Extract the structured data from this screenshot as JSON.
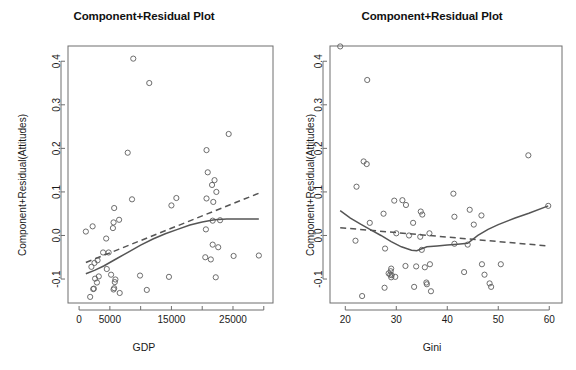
{
  "figure": {
    "width": 576,
    "height": 370,
    "background": "#ffffff",
    "point_color": "#5d5d5d",
    "line_color": "#555555",
    "axis_color": "#6e6e6e"
  },
  "panels": [
    {
      "id": "gdp-panel",
      "title": "Component+Residual Plot",
      "xlabel": "GDP",
      "ylabel": "Component+Residual(Attitudes)"
    },
    {
      "id": "gini-panel",
      "title": "Component+Residual Plot",
      "xlabel": "Gini",
      "ylabel": "Component+Residual(Attitudes)"
    }
  ],
  "chart_data": [
    {
      "type": "scatter",
      "id": "gdp-panel",
      "title": "Component+Residual Plot",
      "xlabel": "GDP",
      "ylabel": "Component+Residual(Attitudes)",
      "xlim": [
        -1800,
        31500
      ],
      "ylim": [
        -0.155,
        0.435
      ],
      "grid": false,
      "legend": "none",
      "xticks": [
        0,
        5000,
        10000,
        15000,
        20000,
        25000,
        30000
      ],
      "xticklabels": [
        "0",
        "5000",
        "",
        "15000",
        "",
        "25000",
        ""
      ],
      "yticks": [
        -0.1,
        0.0,
        0.1,
        0.2,
        0.3,
        0.4
      ],
      "yticklabels": [
        "-0.1",
        "0.0",
        "0.1",
        "0.2",
        "0.3",
        "0.4"
      ],
      "points": [
        [
          8800,
          0.406
        ],
        [
          11400,
          0.35
        ],
        [
          7900,
          0.19
        ],
        [
          20700,
          0.196
        ],
        [
          24300,
          0.233
        ],
        [
          20900,
          0.145
        ],
        [
          22000,
          0.127
        ],
        [
          21600,
          0.116
        ],
        [
          20700,
          0.085
        ],
        [
          8600,
          0.083
        ],
        [
          15800,
          0.086
        ],
        [
          22300,
          0.1
        ],
        [
          21800,
          0.077
        ],
        [
          15000,
          0.069
        ],
        [
          5700,
          0.063
        ],
        [
          6500,
          0.036
        ],
        [
          5600,
          0.03
        ],
        [
          5500,
          0.017
        ],
        [
          21700,
          0.034
        ],
        [
          22900,
          0.035
        ],
        [
          1100,
          0.009
        ],
        [
          2200,
          0.021
        ],
        [
          20600,
          0.014
        ],
        [
          4400,
          -0.007
        ],
        [
          3900,
          -0.039
        ],
        [
          20500,
          -0.05
        ],
        [
          4800,
          -0.039
        ],
        [
          2000,
          -0.072
        ],
        [
          3000,
          -0.057
        ],
        [
          2500,
          -0.063
        ],
        [
          21700,
          -0.021
        ],
        [
          22600,
          -0.027
        ],
        [
          21400,
          -0.055
        ],
        [
          25100,
          -0.047
        ],
        [
          29200,
          -0.046
        ],
        [
          4500,
          -0.077
        ],
        [
          2600,
          -0.099
        ],
        [
          3200,
          -0.094
        ],
        [
          5200,
          -0.09
        ],
        [
          9900,
          -0.092
        ],
        [
          14600,
          -0.095
        ],
        [
          22200,
          -0.096
        ],
        [
          2900,
          -0.108
        ],
        [
          5800,
          -0.107
        ],
        [
          5900,
          -0.101
        ],
        [
          2300,
          -0.123
        ],
        [
          2400,
          -0.122
        ],
        [
          5600,
          -0.124
        ],
        [
          5700,
          -0.121
        ],
        [
          11000,
          -0.125
        ],
        [
          1800,
          -0.141
        ],
        [
          6600,
          -0.132
        ]
      ],
      "smooth_curve": [
        [
          1100,
          -0.088
        ],
        [
          2500,
          -0.08
        ],
        [
          4000,
          -0.07
        ],
        [
          6000,
          -0.054
        ],
        [
          8000,
          -0.038
        ],
        [
          10000,
          -0.022
        ],
        [
          12000,
          -0.008
        ],
        [
          14000,
          0.004
        ],
        [
          16000,
          0.014
        ],
        [
          18000,
          0.024
        ],
        [
          20000,
          0.031
        ],
        [
          22000,
          0.036
        ],
        [
          24000,
          0.038
        ],
        [
          26000,
          0.038
        ],
        [
          29200,
          0.038
        ]
      ],
      "linear_fit": [
        [
          1100,
          -0.062
        ],
        [
          29200,
          0.097
        ]
      ]
    },
    {
      "type": "scatter",
      "id": "gini-panel",
      "title": "Component+Residual Plot",
      "xlabel": "Gini",
      "ylabel": "Component+Residual(Attitudes)",
      "xlim": [
        17.0,
        62.5
      ],
      "ylim": [
        -0.155,
        0.435
      ],
      "grid": false,
      "legend": "none",
      "xticks": [
        20,
        30,
        40,
        50,
        60
      ],
      "xticklabels": [
        "20",
        "30",
        "40",
        "50",
        "60"
      ],
      "yticks": [
        -0.1,
        0.0,
        0.1,
        0.2,
        0.3,
        0.4
      ],
      "yticklabels": [
        "-0.1",
        "0.0",
        "0.1",
        "0.2",
        "0.3",
        "0.4"
      ],
      "points": [
        [
          19.0,
          0.434
        ],
        [
          24.3,
          0.357
        ],
        [
          23.6,
          0.17
        ],
        [
          24.2,
          0.164
        ],
        [
          22.2,
          0.112
        ],
        [
          55.9,
          0.184
        ],
        [
          29.6,
          0.08
        ],
        [
          31.2,
          0.081
        ],
        [
          31.9,
          0.07
        ],
        [
          41.2,
          0.096
        ],
        [
          27.5,
          0.05
        ],
        [
          34.8,
          0.055
        ],
        [
          35.1,
          0.048
        ],
        [
          41.4,
          0.043
        ],
        [
          44.4,
          0.059
        ],
        [
          46.7,
          0.046
        ],
        [
          59.8,
          0.068
        ],
        [
          33.3,
          0.029
        ],
        [
          24.8,
          0.029
        ],
        [
          45.2,
          0.025
        ],
        [
          30.0,
          0.005
        ],
        [
          32.5,
          0.0
        ],
        [
          34.7,
          -0.003
        ],
        [
          36.5,
          0.005
        ],
        [
          41.4,
          -0.019
        ],
        [
          44.0,
          -0.021
        ],
        [
          22.0,
          -0.012
        ],
        [
          27.8,
          -0.03
        ],
        [
          35.0,
          -0.033
        ],
        [
          29.0,
          -0.076
        ],
        [
          31.8,
          -0.07
        ],
        [
          33.9,
          -0.071
        ],
        [
          35.6,
          -0.073
        ],
        [
          36.6,
          -0.066
        ],
        [
          43.3,
          -0.084
        ],
        [
          46.8,
          -0.066
        ],
        [
          47.3,
          -0.09
        ],
        [
          50.5,
          -0.066
        ],
        [
          28.5,
          -0.087
        ],
        [
          28.8,
          -0.09
        ],
        [
          29.1,
          -0.091
        ],
        [
          29.0,
          -0.096
        ],
        [
          29.8,
          -0.095
        ],
        [
          27.7,
          -0.12
        ],
        [
          33.5,
          -0.118
        ],
        [
          35.9,
          -0.108
        ],
        [
          36.0,
          -0.112
        ],
        [
          36.8,
          -0.128
        ],
        [
          23.3,
          -0.139
        ],
        [
          48.3,
          -0.11
        ],
        [
          48.6,
          -0.118
        ],
        [
          28.9,
          -0.082
        ]
      ],
      "smooth_curve": [
        [
          19.0,
          0.057
        ],
        [
          21.0,
          0.04
        ],
        [
          23.0,
          0.026
        ],
        [
          25.0,
          0.013
        ],
        [
          27.0,
          0.0
        ],
        [
          29.0,
          -0.014
        ],
        [
          31.0,
          -0.026
        ],
        [
          33.0,
          -0.034
        ],
        [
          34.0,
          -0.035
        ],
        [
          36.0,
          -0.026
        ],
        [
          38.0,
          -0.024
        ],
        [
          40.0,
          -0.022
        ],
        [
          42.0,
          -0.02
        ],
        [
          44.0,
          -0.018
        ],
        [
          46.0,
          0.0
        ],
        [
          48.0,
          0.014
        ],
        [
          50.0,
          0.025
        ],
        [
          53.3,
          0.04
        ],
        [
          56.0,
          0.051
        ],
        [
          59.8,
          0.068
        ]
      ],
      "linear_fit": [
        [
          19.0,
          0.018
        ],
        [
          59.8,
          -0.024
        ]
      ]
    }
  ]
}
